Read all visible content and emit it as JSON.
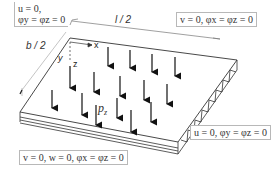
{
  "diagram": {
    "title": "",
    "boundary_conditions": {
      "top_left": {
        "line1": "u = 0,",
        "line2": "φy = φz = 0"
      },
      "top_right": {
        "text": "v = 0,  φx = φz = 0"
      },
      "right": {
        "text": "u = 0,  φy = φz = 0"
      },
      "bottom": {
        "text": "v = 0,  w = 0, φx = φz = 0"
      }
    },
    "dimensions": {
      "length": "l / 2",
      "width": "b / 2"
    },
    "axes": {
      "x": "x",
      "y": "y",
      "z": "z"
    },
    "load": {
      "label": "pz",
      "description": "uniform distributed pressure (downward arrows)"
    },
    "colors": {
      "lines": "#333333",
      "box_border": "#b8b8b8"
    }
  }
}
